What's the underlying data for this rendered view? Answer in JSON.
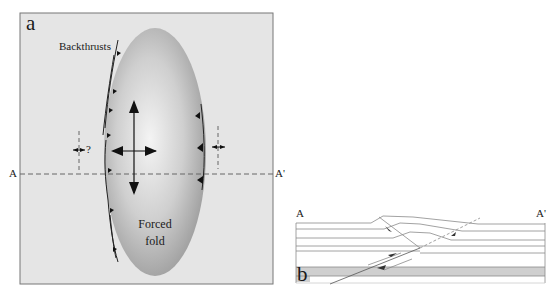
{
  "figure": {
    "panel_a": {
      "letter": "a",
      "labels": {
        "backthrusts": "Backthrusts",
        "forced_fold_line1": "Forced",
        "forced_fold_line2": "fold",
        "question_mark": "?",
        "section_start": "A",
        "section_end": "A'"
      },
      "colors": {
        "background": "#e6e6e6",
        "fold_light": "#f2f2f2",
        "fold_dark": "#9a9a9a",
        "ink": "#1a1a1a"
      }
    },
    "panel_b": {
      "letter": "b",
      "labels": {
        "section_start": "A",
        "section_end": "A'"
      },
      "colors": {
        "shaded_layer": "#cfcfcf",
        "line": "#8a8a8a"
      }
    }
  }
}
